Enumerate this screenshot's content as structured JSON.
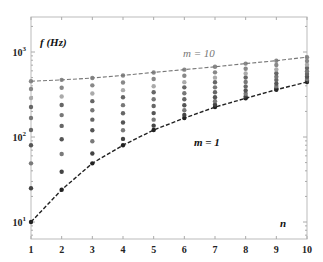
{
  "chart_data": {
    "type": "scatter",
    "title": "",
    "xlabel": "n",
    "ylabel": "f (Hz)",
    "yscale": "log",
    "xlim": [
      1,
      10
    ],
    "ylim": [
      7,
      2000
    ],
    "grid": false,
    "x": [
      1,
      2,
      3,
      4,
      5,
      6,
      7,
      8,
      9,
      10
    ],
    "x_tick_labels": [
      "1",
      "2",
      "3",
      "4",
      "5",
      "6",
      "7",
      "8",
      "9",
      "10"
    ],
    "y_ticks": [
      10,
      100,
      1000
    ],
    "y_tick_labels": [
      "10^1",
      "10^2",
      "10^3"
    ],
    "annotations": [
      {
        "text": "m = 10",
        "near": "upper dashed curve",
        "color": "#777777"
      },
      {
        "text": "m = 1",
        "near": "lower dashed curve",
        "color": "#111111"
      },
      {
        "text": "f (Hz)",
        "role": "y-axis label"
      },
      {
        "text": "n",
        "role": "x-axis label"
      }
    ],
    "series": [
      {
        "name": "m = 1",
        "style": "dashed line + markers",
        "color": "#222222",
        "values": [
          10,
          24,
          49,
          80,
          121,
          167,
          225,
          285,
          360,
          444
        ]
      },
      {
        "name": "m = 2",
        "style": "markers",
        "color": "#444444",
        "values": [
          25,
          39,
          64,
          95,
          136,
          182,
          240,
          300,
          374,
          458
        ]
      },
      {
        "name": "m = 3",
        "style": "markers",
        "color": "#7a7a7a",
        "values": [
          49,
          63,
          89,
          120,
          160,
          206,
          264,
          323,
          397,
          482
        ]
      },
      {
        "name": "m = 4",
        "style": "markers",
        "color": "#555555",
        "values": [
          80,
          94,
          120,
          148,
          191,
          236,
          293,
          353,
          425,
          513
        ]
      },
      {
        "name": "m = 5",
        "style": "markers",
        "color": "#666666",
        "values": [
          121,
          135,
          160,
          190,
          232,
          278,
          336,
          394,
          468,
          550
        ]
      },
      {
        "name": "m = 6",
        "style": "markers",
        "color": "#777777",
        "values": [
          167,
          181,
          206,
          237,
          278,
          327,
          384,
          444,
          511,
          595
        ]
      },
      {
        "name": "m = 7",
        "style": "markers",
        "color": "#666666",
        "values": [
          225,
          238,
          264,
          293,
          336,
          384,
          441,
          501,
          562,
          650
        ]
      },
      {
        "name": "m = 8",
        "style": "markers",
        "color": "#aaaaaa",
        "values": [
          287,
          300,
          325,
          356,
          395,
          442,
          499,
          560,
          623,
          710
        ]
      },
      {
        "name": "m = 9",
        "style": "markers",
        "color": "#888888",
        "values": [
          367,
          380,
          405,
          438,
          481,
          525,
          576,
          636,
          702,
          785
        ]
      },
      {
        "name": "m = 10",
        "style": "dashed line + markers",
        "color": "#888888",
        "values": [
          453,
          470,
          495,
          530,
          575,
          620,
          670,
          730,
          790,
          870
        ]
      }
    ]
  },
  "labels": {
    "ylabel": "f (Hz)",
    "xlabel": "n",
    "m_top": "m = 10",
    "m_bottom": "m = 1"
  }
}
